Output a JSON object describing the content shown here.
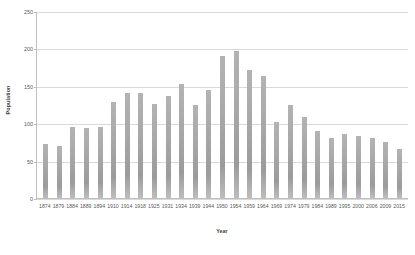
{
  "chart_data": {
    "type": "bar",
    "title": "",
    "xlabel": "Year",
    "ylabel": "Population",
    "ylim": [
      0,
      250
    ],
    "yticks": [
      0,
      50,
      100,
      150,
      200,
      250
    ],
    "grid": true,
    "legend": false,
    "bar_color": "#a6a6a6",
    "categories": [
      "1874",
      "1879",
      "1884",
      "1889",
      "1894",
      "1910",
      "1914",
      "1918",
      "1925",
      "1931",
      "1934",
      "1939",
      "1944",
      "1950",
      "1954",
      "1959",
      "1964",
      "1969",
      "1974",
      "1979",
      "1984",
      "1989",
      "1995",
      "2000",
      "2006",
      "2009",
      "2015"
    ],
    "values": [
      72,
      70,
      95,
      94,
      95,
      129,
      141,
      140,
      126,
      136,
      152,
      125,
      144,
      190,
      197,
      171,
      163,
      101,
      125,
      108,
      89,
      80,
      85,
      83,
      80,
      75,
      65
    ],
    "series": [
      {
        "name": "Population",
        "values": [
          72,
          70,
          95,
          94,
          95,
          129,
          141,
          140,
          126,
          136,
          152,
          125,
          144,
          190,
          197,
          171,
          163,
          101,
          125,
          108,
          89,
          80,
          85,
          83,
          80,
          75,
          65
        ]
      }
    ]
  }
}
